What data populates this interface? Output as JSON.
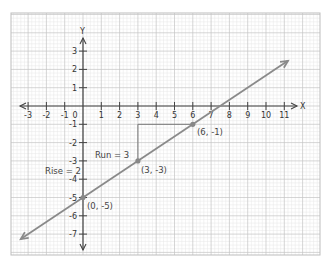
{
  "chart_data": {
    "type": "line",
    "title": "",
    "xlabel": "X",
    "ylabel": "Y",
    "xlim": [
      -3,
      11
    ],
    "ylim": [
      -7,
      3
    ],
    "grid": true,
    "x_ticks": [
      -3,
      -2,
      -1,
      0,
      1,
      2,
      3,
      4,
      5,
      6,
      7,
      8,
      9,
      10,
      11
    ],
    "y_ticks": [
      3,
      2,
      1,
      -1,
      -2,
      -3,
      -4,
      -5,
      -6,
      -7
    ],
    "x_tick_labels": [
      "-3",
      "-2",
      "-1",
      "0",
      "1",
      "2",
      "3",
      "4",
      "5",
      "6",
      "7",
      "8",
      "9",
      "10",
      "11"
    ],
    "y_tick_labels": [
      "3",
      "2",
      "1",
      "-1",
      "-2",
      "-3",
      "-4",
      "-5",
      "-6",
      "-7"
    ],
    "series": [
      {
        "name": "line",
        "equation": "y = 2/3 x - 5",
        "slope": 0.6667,
        "intercept": -5,
        "x": [
          -3.4,
          11.2
        ],
        "y": [
          -7.27,
          2.47
        ],
        "color": "#8a8a8a",
        "arrows": "both"
      }
    ],
    "points": [
      {
        "x": 0,
        "y": -5,
        "label": "(0, -5)"
      },
      {
        "x": 3,
        "y": -3,
        "label": "(3, -3)"
      },
      {
        "x": 6,
        "y": -1,
        "label": "(6, -1)"
      }
    ],
    "annotations": [
      {
        "text": "Run = 3",
        "from": [
          3,
          -1
        ],
        "to": [
          6,
          -1
        ],
        "type": "horizontal-segment"
      },
      {
        "text": "Rise = 2",
        "from": [
          3,
          -3
        ],
        "to": [
          3,
          -1
        ],
        "type": "vertical-segment"
      }
    ]
  },
  "labels": {
    "x_axis": "X",
    "y_axis": "Y",
    "run": "Run = 3",
    "rise": "Rise = 2",
    "p0": "(0, -5)",
    "p1": "(3, -3)",
    "p2": "(6, -1)"
  },
  "colors": {
    "major_grid": "#c4c4c4",
    "minor_grid": "#e6e6e6",
    "axis": "#444444",
    "line": "#8a8a8a",
    "frame": "#bdbdbd"
  }
}
